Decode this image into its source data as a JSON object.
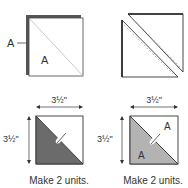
{
  "panels": {
    "top_left": {
      "outer_label": "A",
      "inner_label": "A"
    },
    "top_right": {},
    "bottom_left": {
      "width_label": "3½\"",
      "height_label": "3½\"",
      "caption": "Make 2 units.",
      "fill_color": "#6b6b6b"
    },
    "bottom_right": {
      "width_label": "3½\"",
      "height_label": "3½\"",
      "label_upper": "A",
      "label_lower": "A",
      "caption": "Make 2 units.",
      "fill_color": "#b3b3b3"
    }
  },
  "colors": {
    "stroke": "#333333",
    "back_square": "#555555",
    "dashed": "#999999"
  }
}
